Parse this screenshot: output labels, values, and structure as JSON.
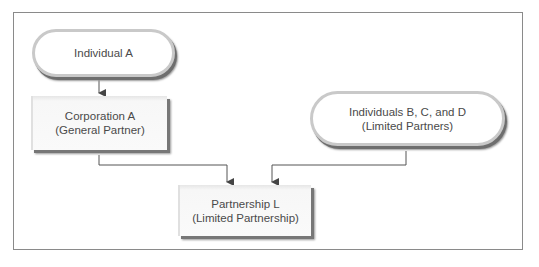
{
  "diagram": {
    "nodes": [
      {
        "id": "individual-a",
        "shape": "pill",
        "lines": [
          "Individual A"
        ]
      },
      {
        "id": "corporation-a",
        "shape": "box",
        "lines": [
          "Corporation A",
          "(General Partner)"
        ]
      },
      {
        "id": "individuals-bcd",
        "shape": "pill",
        "lines": [
          "Individuals B, C, and D",
          "(Limited Partners)"
        ]
      },
      {
        "id": "partnership-l",
        "shape": "box",
        "lines": [
          "Partnership L",
          "(Limited Partnership)"
        ]
      }
    ],
    "edges": [
      {
        "from": "individual-a",
        "to": "corporation-a"
      },
      {
        "from": "corporation-a",
        "to": "partnership-l"
      },
      {
        "from": "individuals-bcd",
        "to": "partnership-l"
      }
    ],
    "colors": {
      "frame": "#8a8a8a",
      "line": "#555555",
      "text": "#4a4a4a",
      "shadow": "#6e6e6e"
    }
  }
}
